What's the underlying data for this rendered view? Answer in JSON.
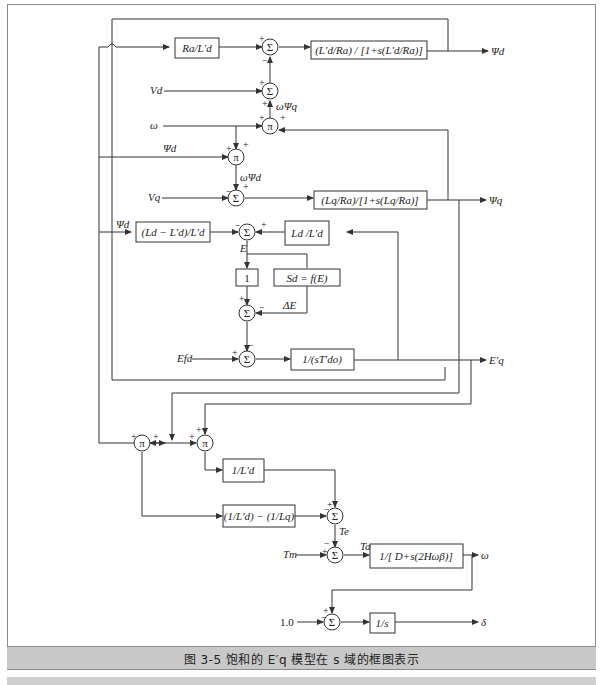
{
  "figure": {
    "caption": "图 3-5    饱和的 E′q 模型在 s 域的框图表示",
    "colors": {
      "line": "#333333",
      "frame": "#8a8a8a",
      "caption_bg": "#c8c8c8"
    }
  },
  "blocks": {
    "ra_over_ld": "Ra/L′d",
    "psi_d_tf": "(L′d/Ra) / [1+s(L′d/Ra)]",
    "psi_q_tf": "(Lq/Ra)/[1+s(Lq/Ra)]",
    "ld_diff": "(Ld − L′d)/L′d",
    "ld_ratio": "Ld /L′d",
    "unity": "1",
    "saturation": "Sd = f(E)",
    "field_tf": "1/(sT′do)",
    "inv_ld": "1/L′d",
    "ld_lq_diff": "(1/L′d) − (1/Lq)",
    "swing_tf": "1/[ D+s(2Hωβ)]",
    "integrator": "1/s"
  },
  "signals": {
    "psi_d_out": "Ψd",
    "psi_q_out": "Ψq",
    "eq_out": "E′q",
    "omega_out": "ω",
    "delta_out": "δ",
    "vd_in": "Vd",
    "vq_in": "Vq",
    "omega_in": "ω",
    "psi_d_in": "Ψd",
    "psi_d_in2": "Ψd",
    "efd_in": "Efd",
    "tm_in": "Tm",
    "one_in": "1.0",
    "omega_psi_q": "ωΨq",
    "omega_psi_d": "ωΨd",
    "e_label": "E",
    "delta_e": "ΔE",
    "te": "Te",
    "ta": "Ta"
  },
  "nodes": {
    "sum": "Σ",
    "mul": "π"
  },
  "signs": {
    "plus": "+",
    "minus": "−"
  }
}
